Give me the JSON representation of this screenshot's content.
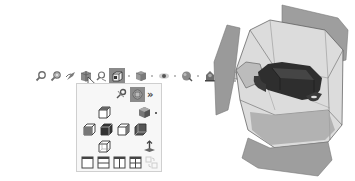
{
  "toolbar": {
    "items": [
      {
        "icon": "zoom-to-fit-icon"
      },
      {
        "icon": "zoom-to-area-icon"
      },
      {
        "icon": "previous-view-icon"
      },
      {
        "icon": "section-view-icon"
      },
      {
        "icon": "dynamic-annotation-views-icon"
      },
      {
        "icon": "view-orientation-icon",
        "active": true,
        "has_dropdown": true
      },
      {
        "icon": "display-style-icon",
        "has_dropdown": true
      },
      {
        "icon": "hide-show-items-icon",
        "has_dropdown": true
      },
      {
        "icon": "edit-appearance-icon",
        "has_dropdown": true
      },
      {
        "icon": "apply-scene-icon",
        "has_dropdown": true
      },
      {
        "icon": "view-settings-icon",
        "has_dropdown": true
      }
    ]
  },
  "view_orientation_menu": {
    "top_row": [
      {
        "icon": "pin-icon"
      },
      {
        "icon": "view-selector-icon",
        "selected": true
      },
      {
        "icon": "more-chevron-icon",
        "label": "»"
      }
    ],
    "rows": [
      [
        {
          "icon": "top-view-icon"
        },
        {
          "icon": "isometric-color-cube-icon",
          "has_dropdown": true
        }
      ],
      [
        {
          "icon": "front-view-icon"
        },
        {
          "icon": "left-view-icon"
        },
        {
          "icon": "right-view-icon"
        },
        {
          "icon": "back-view-icon"
        }
      ],
      [
        {
          "icon": "bottom-view-icon"
        },
        {
          "icon": "normal-to-icon"
        }
      ],
      [
        {
          "icon": "single-view-icon"
        },
        {
          "icon": "two-view-horizontal-icon"
        },
        {
          "icon": "two-view-vertical-icon"
        },
        {
          "icon": "four-view-icon"
        },
        {
          "icon": "link-views-icon",
          "disabled": true
        }
      ]
    ]
  },
  "colors": {
    "active_bg": "#8a8a8a",
    "menu_bg": "#f7f7f7",
    "menu_border": "#cfcfcf",
    "icon_gray": "#6e6e6e",
    "model_flap": "#9a9a9a",
    "model_box": "#d8d8d8",
    "model_part": "#2e2e2e"
  }
}
